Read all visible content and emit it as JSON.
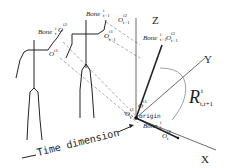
{
  "diagram": {
    "figures": [
      {
        "bone_label": "Bone",
        "bone_sub": "t",
        "bone_sup": "i",
        "joint_top": "O",
        "joint_top_sub": "t",
        "joint_top_sup": "i2",
        "joint_bottom": "O",
        "joint_bottom_sub": "t",
        "joint_bottom_sup": "i1"
      },
      {
        "bone_label": "Bone",
        "bone_sub": "t+1",
        "bone_sup": "i",
        "joint_top": "O",
        "joint_top_sub": "t+1",
        "joint_top_sup": "i2",
        "joint_bottom": "O",
        "joint_bottom_sub": "t+1",
        "joint_bottom_sup": "i1"
      }
    ],
    "axes": {
      "x": "X",
      "y": "Y",
      "z": "Z"
    },
    "origin_label": "origin",
    "rotation": {
      "symbol": "R",
      "sub": "t,t+1",
      "sup": "i"
    },
    "axis_frame_labels": {
      "bone_t1": {
        "text": "Bone",
        "sub": "t+1",
        "sup": "i"
      },
      "joint_t1_top": {
        "text": "O",
        "sub": "t+1",
        "sup": "i2"
      },
      "joint_t1_origin": {
        "text": "O",
        "sub": "t+1",
        "sup": "i1"
      },
      "bone_t": {
        "text": "Bone",
        "sub": "t",
        "sup": "i"
      },
      "joint_t_end": {
        "text": "O",
        "sub": "t",
        "sup": "i2"
      },
      "joint_t_origin": {
        "text": "O",
        "sub": "t",
        "sup": "i1"
      },
      "far_joint_top": {
        "text": "O",
        "sub": "t+1",
        "sup": "i2"
      },
      "far_joint_mid": {
        "text": "O",
        "sub": "t+1",
        "sup": "i1"
      }
    },
    "time_axis_label": "Time dimension"
  }
}
